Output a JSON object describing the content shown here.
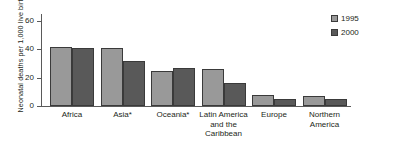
{
  "chart_data": {
    "type": "bar",
    "title": "",
    "xlabel": "",
    "ylabel": "Neonatal deaths per 1,000 live births",
    "ylim": [
      0,
      65
    ],
    "yticks": [
      0,
      20,
      40,
      60
    ],
    "grid": false,
    "legend_position": "top-right",
    "categories": [
      "Africa",
      "Asia*",
      "Oceania*",
      "Latin America and the Caribbean",
      "Europe",
      "Northern America"
    ],
    "series": [
      {
        "name": "1995",
        "color": "#999999",
        "values": [
          42,
          41,
          25,
          26,
          8,
          7
        ]
      },
      {
        "name": "2000",
        "color": "#595959",
        "values": [
          41,
          32,
          27,
          16,
          5,
          5
        ]
      }
    ]
  },
  "axis": {
    "y_title": "Neonatal deaths per 1,000 live births",
    "tick_labels": [
      "60",
      "40",
      "20",
      "0"
    ]
  },
  "categories_display": [
    {
      "lines": [
        "Africa"
      ]
    },
    {
      "lines": [
        "Asia*"
      ]
    },
    {
      "lines": [
        "Oceania*"
      ]
    },
    {
      "lines": [
        "Latin America",
        "and the",
        "Caribbean"
      ]
    },
    {
      "lines": [
        "Europe"
      ]
    },
    {
      "lines": [
        "Northern",
        "America"
      ]
    }
  ],
  "legend": {
    "items": [
      {
        "label": "1995",
        "color": "#999999"
      },
      {
        "label": "2000",
        "color": "#595959"
      }
    ]
  }
}
